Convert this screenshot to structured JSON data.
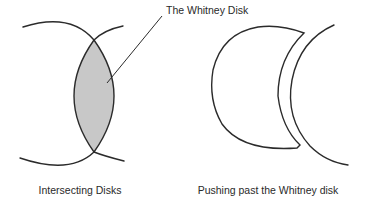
{
  "figure": {
    "callout_label": "The Whitney Disk",
    "left_panel": {
      "caption": "Intersecting Disks",
      "shaded_region_color": "#c8c8c8"
    },
    "right_panel": {
      "caption": "Pushing past the Whitney disk"
    },
    "colors": {
      "stroke": "#2b2b2b",
      "background": "#ffffff",
      "text": "#2a2a2a"
    }
  }
}
